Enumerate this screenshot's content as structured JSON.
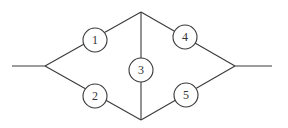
{
  "diagram": {
    "type": "bridge-network",
    "colors": {
      "stroke": "#3a3a3a",
      "text": "#333333",
      "background": "#ffffff"
    },
    "terminals": {
      "left": {
        "x1": 12,
        "y1": 66,
        "x2": 45,
        "y2": 66
      },
      "right": {
        "x1": 235,
        "y1": 66,
        "x2": 272,
        "y2": 66
      }
    },
    "junctions": {
      "left": {
        "x": 45,
        "y": 66
      },
      "top": {
        "x": 141,
        "y": 12
      },
      "bottom": {
        "x": 141,
        "y": 120
      },
      "right": {
        "x": 235,
        "y": 66
      }
    },
    "nodes": [
      {
        "id": "1",
        "label": "1",
        "cx": 95,
        "cy": 40,
        "r": 12
      },
      {
        "id": "2",
        "label": "2",
        "cx": 95,
        "cy": 96,
        "r": 12
      },
      {
        "id": "3",
        "label": "3",
        "cx": 141,
        "cy": 70,
        "r": 12
      },
      {
        "id": "4",
        "label": "4",
        "cx": 185,
        "cy": 37,
        "r": 12
      },
      {
        "id": "5",
        "label": "5",
        "cx": 186,
        "cy": 95,
        "r": 12
      }
    ],
    "edges": [
      {
        "from": "left-terminal",
        "to": "left-junction"
      },
      {
        "from": "left-junction",
        "to": "1"
      },
      {
        "from": "1",
        "to": "top-junction"
      },
      {
        "from": "left-junction",
        "to": "2"
      },
      {
        "from": "2",
        "to": "bottom-junction"
      },
      {
        "from": "top-junction",
        "to": "3"
      },
      {
        "from": "3",
        "to": "bottom-junction"
      },
      {
        "from": "top-junction",
        "to": "4"
      },
      {
        "from": "4",
        "to": "right-junction"
      },
      {
        "from": "bottom-junction",
        "to": "5"
      },
      {
        "from": "5",
        "to": "right-junction"
      },
      {
        "from": "right-junction",
        "to": "right-terminal"
      }
    ]
  }
}
